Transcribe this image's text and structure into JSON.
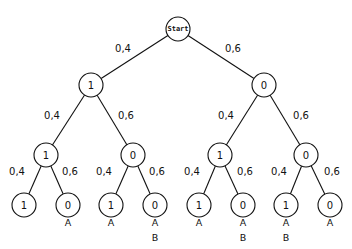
{
  "diagram": {
    "type": "probability-tree",
    "root": {
      "id": "start",
      "label": "Start",
      "x": 178,
      "y": 29
    },
    "nodes": [
      {
        "id": "n1",
        "label": "1",
        "x": 91,
        "y": 85,
        "parent": "start",
        "prob": "0,4",
        "prob_x": 123,
        "prob_y": 52,
        "outcomes": []
      },
      {
        "id": "n2",
        "label": "0",
        "x": 264,
        "y": 85,
        "parent": "start",
        "prob": "0,6",
        "prob_x": 233,
        "prob_y": 52,
        "outcomes": []
      },
      {
        "id": "n11",
        "label": "1",
        "x": 46,
        "y": 155,
        "parent": "n1",
        "prob": "0,4",
        "prob_x": 52,
        "prob_y": 119,
        "outcomes": []
      },
      {
        "id": "n12",
        "label": "0",
        "x": 133,
        "y": 155,
        "parent": "n1",
        "prob": "0,6",
        "prob_x": 126,
        "prob_y": 119,
        "outcomes": []
      },
      {
        "id": "n21",
        "label": "1",
        "x": 220,
        "y": 155,
        "parent": "n2",
        "prob": "0,4",
        "prob_x": 226,
        "prob_y": 119,
        "outcomes": []
      },
      {
        "id": "n22",
        "label": "0",
        "x": 306,
        "y": 155,
        "parent": "n2",
        "prob": "0,6",
        "prob_x": 301,
        "prob_y": 119,
        "outcomes": []
      },
      {
        "id": "n111",
        "label": "1",
        "x": 24,
        "y": 205,
        "parent": "n11",
        "prob": "0,4",
        "prob_x": 17,
        "prob_y": 175,
        "outcomes": []
      },
      {
        "id": "n112",
        "label": "0",
        "x": 68,
        "y": 205,
        "parent": "n11",
        "prob": "0,6",
        "prob_x": 70,
        "prob_y": 175,
        "outcomes": [
          "A"
        ]
      },
      {
        "id": "n121",
        "label": "1",
        "x": 111,
        "y": 205,
        "parent": "n12",
        "prob": "0,4",
        "prob_x": 104,
        "prob_y": 175,
        "outcomes": [
          "A"
        ]
      },
      {
        "id": "n122",
        "label": "0",
        "x": 155,
        "y": 205,
        "parent": "n12",
        "prob": "0,6",
        "prob_x": 157,
        "prob_y": 175,
        "outcomes": [
          "A",
          "B"
        ]
      },
      {
        "id": "n211",
        "label": "1",
        "x": 199,
        "y": 205,
        "parent": "n21",
        "prob": "0,4",
        "prob_x": 192,
        "prob_y": 175,
        "outcomes": [
          "A"
        ]
      },
      {
        "id": "n212",
        "label": "0",
        "x": 243,
        "y": 205,
        "parent": "n21",
        "prob": "0,6",
        "prob_x": 245,
        "prob_y": 175,
        "outcomes": [
          "A",
          "B"
        ]
      },
      {
        "id": "n221",
        "label": "1",
        "x": 286,
        "y": 205,
        "parent": "n22",
        "prob": "0,4",
        "prob_x": 279,
        "prob_y": 175,
        "outcomes": [
          "A",
          "B"
        ]
      },
      {
        "id": "n222",
        "label": "0",
        "x": 330,
        "y": 205,
        "parent": "n22",
        "prob": "0,6",
        "prob_x": 332,
        "prob_y": 175,
        "outcomes": [
          "A"
        ]
      }
    ],
    "node_radius": 12,
    "root_radius": 12
  }
}
